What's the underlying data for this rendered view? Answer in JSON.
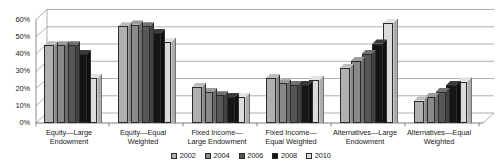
{
  "chart_data": {
    "type": "bar",
    "title": "",
    "subtitle": "",
    "xlabel": "",
    "ylabel": "",
    "ylim": [
      0,
      60
    ],
    "ytick_labels": [
      "0%",
      "10%",
      "20%",
      "30%",
      "40%",
      "50%",
      "60%"
    ],
    "ytick_values": [
      0,
      10,
      20,
      30,
      40,
      50,
      60
    ],
    "grid": true,
    "legend_position": "bottom",
    "style": "3d-bar",
    "categories": [
      "Equity—Large Endowment",
      "Equity—Equal Weighted",
      "Fixed Income—Large Endowment",
      "Fixed Income—Equal Weighted",
      "Alternatives—Large Endowment",
      "Alternatives—Equal Weighted"
    ],
    "category_lines": [
      [
        "Equity—Large",
        "Endowment"
      ],
      [
        "Equity—Equal",
        "Weighted"
      ],
      [
        "Fixed Income—",
        "Large Endowment"
      ],
      [
        "Fixed Income—",
        "Equal Weighted"
      ],
      [
        "Alternatives—Large",
        "Endowment"
      ],
      [
        "Alternatives—Equal",
        "Weighted"
      ]
    ],
    "series": [
      {
        "name": "2002",
        "color": "#b0b0b0",
        "values": [
          45,
          56,
          21,
          26,
          32,
          13
        ]
      },
      {
        "name": "2004",
        "color": "#8a8a8a",
        "values": [
          45,
          57,
          18,
          23,
          36,
          15
        ]
      },
      {
        "name": "2006",
        "color": "#565656",
        "values": [
          45,
          56,
          16,
          22,
          40,
          18
        ]
      },
      {
        "name": "2008",
        "color": "#151515",
        "values": [
          40,
          52,
          15,
          22,
          46,
          22
        ]
      },
      {
        "name": "2010",
        "color": "#dcdcdc",
        "values": [
          26,
          47,
          15,
          25,
          58,
          24
        ]
      }
    ]
  },
  "legend": {
    "entries": [
      {
        "label": "2002",
        "color": "#b0b0b0"
      },
      {
        "label": "2004",
        "color": "#8a8a8a"
      },
      {
        "label": "2006",
        "color": "#565656"
      },
      {
        "label": "2008",
        "color": "#151515"
      },
      {
        "label": "2010",
        "color": "#dcdcdc"
      }
    ]
  }
}
